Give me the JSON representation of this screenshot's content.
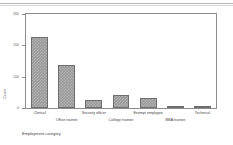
{
  "chart_data": {
    "type": "bar",
    "title": "",
    "xlabel": "Employment category",
    "ylabel": "Count",
    "categories": [
      "Clerical",
      "Office trainee",
      "Security officer",
      "College trainee",
      "Exempt employee",
      "MBA trainee",
      "Technical"
    ],
    "values": [
      227,
      136,
      27,
      41,
      32,
      4,
      1
    ],
    "ylim": [
      0,
      300
    ],
    "yticks": [
      0,
      100,
      200,
      300
    ],
    "ytick_labels": [
      "0",
      "100",
      "200",
      "300"
    ],
    "grid": false,
    "legend": null,
    "bar_color": "#9a9a9a",
    "bar_edge_color": "#6e6e6e",
    "frame_color": "#8d8d8d",
    "background": "#ffffff"
  }
}
